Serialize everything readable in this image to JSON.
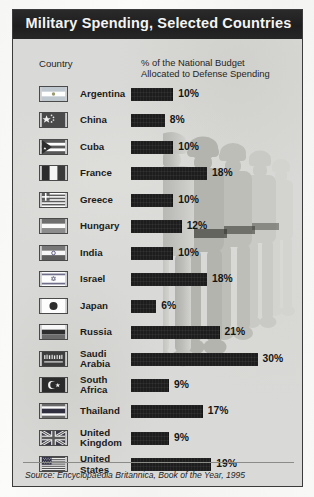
{
  "title": "Military Spending, Selected Countries",
  "headers": {
    "country": "Country",
    "percent_line1": "% of the National Budget",
    "percent_line2": "Allocated to Defense Spending"
  },
  "source": "Source: Encyclopaedia Britannica, Book of the Year, 1995",
  "colors": {
    "titlebar": "#1e1e1e",
    "title_text": "#f4f4f4",
    "panel_bg": "#d9d9d7",
    "bar": "#1d1d1d",
    "border": "#3b3b3b",
    "watermark": "#b9bab5"
  },
  "chart_data": {
    "type": "bar",
    "title": "Military Spending, Selected Countries",
    "subtitle": "% of the National Budget Allocated to Defense Spending",
    "orientation": "horizontal",
    "xlabel": "% of the National Budget Allocated to Defense Spending",
    "ylabel": "Country",
    "xlim": [
      0,
      30
    ],
    "grid": false,
    "legend": false,
    "unit": "%",
    "source": "Source: Encyclopaedia Britannica, Book of the Year, 1995",
    "categories": [
      "Argentina",
      "China",
      "Cuba",
      "France",
      "Greece",
      "Hungary",
      "India",
      "Israel",
      "Japan",
      "Russia",
      "Saudi Arabia",
      "South Africa",
      "Thailand",
      "United Kingdom",
      "United States"
    ],
    "values": [
      10,
      8,
      10,
      18,
      10,
      12,
      10,
      18,
      6,
      21,
      30,
      9,
      17,
      9,
      19
    ],
    "labels": [
      "10%",
      "8%",
      "10%",
      "18%",
      "10%",
      "12%",
      "10%",
      "18%",
      "6%",
      "21%",
      "30%",
      "9%",
      "17%",
      "9%",
      "19%"
    ],
    "rows": [
      {
        "country": "Argentina",
        "lines": [
          "Argentina"
        ],
        "value": 10,
        "label": "10%",
        "flag": "flag-argentina"
      },
      {
        "country": "China",
        "lines": [
          "China"
        ],
        "value": 8,
        "label": "8%",
        "flag": "flag-china"
      },
      {
        "country": "Cuba",
        "lines": [
          "Cuba"
        ],
        "value": 10,
        "label": "10%",
        "flag": "flag-cuba"
      },
      {
        "country": "France",
        "lines": [
          "France"
        ],
        "value": 18,
        "label": "18%",
        "flag": "flag-france"
      },
      {
        "country": "Greece",
        "lines": [
          "Greece"
        ],
        "value": 10,
        "label": "10%",
        "flag": "flag-greece"
      },
      {
        "country": "Hungary",
        "lines": [
          "Hungary"
        ],
        "value": 12,
        "label": "12%",
        "flag": "flag-hungary"
      },
      {
        "country": "India",
        "lines": [
          "India"
        ],
        "value": 10,
        "label": "10%",
        "flag": "flag-india"
      },
      {
        "country": "Israel",
        "lines": [
          "Israel"
        ],
        "value": 18,
        "label": "18%",
        "flag": "flag-israel"
      },
      {
        "country": "Japan",
        "lines": [
          "Japan"
        ],
        "value": 6,
        "label": "6%",
        "flag": "flag-japan"
      },
      {
        "country": "Russia",
        "lines": [
          "Russia"
        ],
        "value": 21,
        "label": "21%",
        "flag": "flag-russia"
      },
      {
        "country": "Saudi Arabia",
        "lines": [
          "Saudi",
          "Arabia"
        ],
        "value": 30,
        "label": "30%",
        "flag": "flag-saudi-arabia"
      },
      {
        "country": "South Africa",
        "lines": [
          "South",
          "Africa"
        ],
        "value": 9,
        "label": "9%",
        "flag": "flag-crescent-star"
      },
      {
        "country": "Thailand",
        "lines": [
          "Thailand"
        ],
        "value": 17,
        "label": "17%",
        "flag": "flag-thailand"
      },
      {
        "country": "United Kingdom",
        "lines": [
          "United",
          "Kingdom"
        ],
        "value": 9,
        "label": "9%",
        "flag": "flag-united-kingdom"
      },
      {
        "country": "United States",
        "lines": [
          "United",
          "States"
        ],
        "value": 19,
        "label": "19%",
        "flag": "flag-united-states"
      }
    ]
  }
}
